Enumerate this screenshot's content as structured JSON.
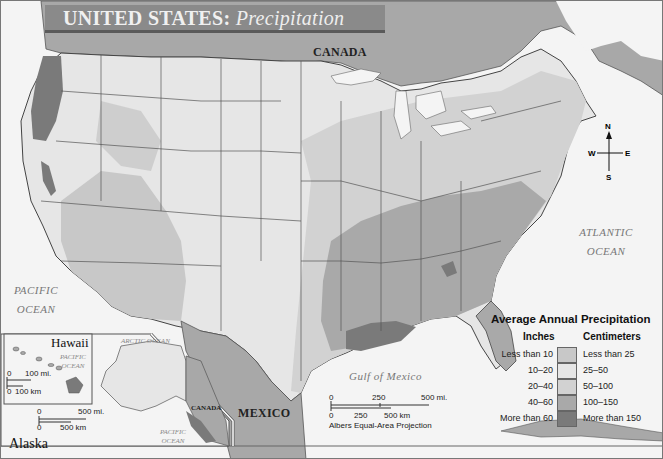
{
  "title": {
    "main": "UNITED STATES:",
    "subtitle": "Precipitation"
  },
  "labels": {
    "canada": "CANADA",
    "mexico": "MEXICO",
    "canada_inset": "CANADA",
    "atlantic_ocean": [
      "ATLANTIC",
      "OCEAN"
    ],
    "pacific_ocean": [
      "PACIFIC",
      "OCEAN"
    ],
    "gulf": "Gulf of Mexico",
    "arctic_ocean": "ARCTIC OCEAN",
    "pacific_ocean_alaska": [
      "PACIFIC",
      "OCEAN"
    ],
    "pacific_ocean_hawaii": [
      "PACIFIC",
      "OCEAN"
    ]
  },
  "compass": {
    "n": "N",
    "s": "S",
    "e": "E",
    "w": "W"
  },
  "insets": {
    "hawaii": {
      "title": "Hawaii",
      "scale": {
        "mi_start": "0",
        "mi_end": "100 mi.",
        "km_start": "0",
        "km_end": "100 km"
      }
    },
    "alaska": {
      "title": "Alaska",
      "scale": {
        "mi_start": "0",
        "mi_end": "500 mi.",
        "km_start": "0",
        "km_end": "500 km"
      }
    }
  },
  "main_scale": {
    "mi": [
      "0",
      "250",
      "500 mi."
    ],
    "km": [
      "0",
      "250",
      "500 km"
    ],
    "projection": "Albers Equal-Area Projection"
  },
  "legend": {
    "title": "Average Annual Precipitation",
    "inches_header": "Inches",
    "cm_header": "Centimeters",
    "rows": [
      {
        "inches": "Less than 10",
        "cm": "Less than 25",
        "color": "#c8c8c8"
      },
      {
        "inches": "10–20",
        "cm": "25–50",
        "color": "#e6e6e6"
      },
      {
        "inches": "20–40",
        "cm": "50–100",
        "color": "#d2d2d2"
      },
      {
        "inches": "40–60",
        "cm": "100–150",
        "color": "#a9a9a9"
      },
      {
        "inches": "More than 60",
        "cm": "More than 150",
        "color": "#7a7a7a"
      }
    ]
  },
  "colors": {
    "water": "#f6f6f6",
    "foreign_land": "#a8a8a8",
    "dry": "#c8c8c8",
    "semi": "#e6e6e6",
    "mid": "#d2d2d2",
    "wet": "#a9a9a9",
    "very_wet": "#7a7a7a",
    "title_bar": "#8a8a8a"
  }
}
